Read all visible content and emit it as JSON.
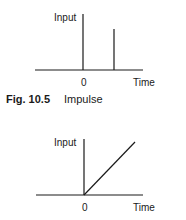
{
  "figures": [
    {
      "kind": "impulse",
      "y_label": "Input",
      "x_label": "Time",
      "origin_label": "0",
      "caption_number": "Fig. 10.5",
      "caption_title": "Impulse"
    },
    {
      "kind": "ramp",
      "y_label": "Input",
      "x_label": "Time",
      "origin_label": "0"
    }
  ],
  "colors": {
    "line": "#1a1a1a",
    "background": "#ffffff"
  }
}
